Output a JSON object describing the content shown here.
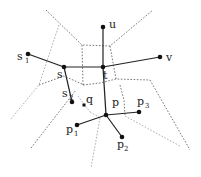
{
  "diagram": {
    "type": "graph-with-voronoi-cells",
    "colors": {
      "edge": "#222222",
      "boundary": "#555555",
      "boundary_light": "#9a9a9a",
      "node": "#111111"
    },
    "nodes": [
      {
        "id": "u",
        "label": "u",
        "sub": "",
        "x": 103,
        "y": 27
      },
      {
        "id": "t",
        "label": "t",
        "sub": "",
        "x": 103,
        "y": 67
      },
      {
        "id": "v",
        "label": "v",
        "sub": "",
        "x": 160,
        "y": 57
      },
      {
        "id": "s",
        "label": "s",
        "sub": "",
        "x": 64,
        "y": 67
      },
      {
        "id": "s1",
        "label": "s",
        "sub": "1",
        "x": 28,
        "y": 54
      },
      {
        "id": "s2",
        "label": "s",
        "sub": "2",
        "x": 72,
        "y": 102
      },
      {
        "id": "q",
        "label": "q",
        "sub": "",
        "x": 84,
        "y": 105
      },
      {
        "id": "p",
        "label": "p",
        "sub": "",
        "x": 106,
        "y": 115
      },
      {
        "id": "p1",
        "label": "p",
        "sub": "1",
        "x": 77,
        "y": 125
      },
      {
        "id": "p2",
        "label": "p",
        "sub": "2",
        "x": 122,
        "y": 137
      },
      {
        "id": "p3",
        "label": "p",
        "sub": "3",
        "x": 139,
        "y": 112
      }
    ],
    "edges": [
      [
        "s1",
        "s"
      ],
      [
        "s",
        "t"
      ],
      [
        "t",
        "u"
      ],
      [
        "t",
        "v"
      ],
      [
        "s",
        "s2"
      ],
      [
        "t",
        "p"
      ],
      [
        "p",
        "p1"
      ],
      [
        "p",
        "p3"
      ],
      [
        "p",
        "p2"
      ]
    ],
    "labels": {
      "u": {
        "text": "u",
        "sub": "",
        "x": 109,
        "y": 28
      },
      "v": {
        "text": "v",
        "sub": "",
        "x": 166,
        "y": 61
      },
      "t": {
        "text": "t",
        "sub": "",
        "x": 103,
        "y": 79
      },
      "s": {
        "text": "s",
        "sub": "",
        "x": 57,
        "y": 78
      },
      "s1": {
        "text": "s",
        "sub": "1",
        "x": 17,
        "y": 60
      },
      "s2": {
        "text": "s",
        "sub": "2",
        "x": 62,
        "y": 97
      },
      "q": {
        "text": "q",
        "sub": "",
        "x": 86,
        "y": 103
      },
      "p": {
        "text": "p",
        "sub": "",
        "x": 112,
        "y": 106
      },
      "p1": {
        "text": "p",
        "sub": "1",
        "x": 66,
        "y": 133
      },
      "p2": {
        "text": "p",
        "sub": "2",
        "x": 117,
        "y": 148
      },
      "p3": {
        "text": "p",
        "sub": "3",
        "x": 137,
        "y": 105
      }
    }
  }
}
